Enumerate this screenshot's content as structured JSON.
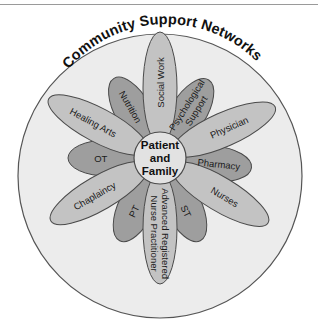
{
  "diagram": {
    "title": "Community Support Networks",
    "center": {
      "lines": [
        "Patient",
        "and",
        "Family"
      ]
    },
    "colors": {
      "outer_circle_fill": "#ececec",
      "outer_circle_stroke": "#555555",
      "long_petal_fill": "#c3c3c3",
      "short_petal_fill": "#9e9e9e",
      "petal_stroke": "#4a4a4a",
      "center_fill": "#e2e2e2"
    },
    "petals": [
      {
        "label": "Social Work",
        "lines": [
          "Social Work"
        ],
        "angle": 0,
        "type": "long"
      },
      {
        "label": "Psychological Support",
        "lines": [
          "Psychological",
          "Support"
        ],
        "angle": 32,
        "type": "short"
      },
      {
        "label": "Physician",
        "lines": [
          "Physician"
        ],
        "angle": 66,
        "type": "long"
      },
      {
        "label": "Pharmacy",
        "lines": [
          "Pharmacy"
        ],
        "angle": 96,
        "type": "short"
      },
      {
        "label": "Nurses",
        "lines": [
          "Nurses"
        ],
        "angle": 121,
        "type": "long"
      },
      {
        "label": "ST",
        "lines": [
          "ST"
        ],
        "angle": 154,
        "type": "short"
      },
      {
        "label": "Advanced Registered Nurse Practitioner",
        "lines": [
          "Advanced Registered",
          "Nurse Practitioner"
        ],
        "angle": 180,
        "type": "long"
      },
      {
        "label": "PT",
        "lines": [
          "PT"
        ],
        "angle": 206,
        "type": "short"
      },
      {
        "label": "Chaplaincy",
        "lines": [
          "Chaplaincy"
        ],
        "angle": 240,
        "type": "long"
      },
      {
        "label": "OT",
        "lines": [
          "OT"
        ],
        "angle": 270,
        "type": "short"
      },
      {
        "label": "Healing Arts",
        "lines": [
          "Healing Arts"
        ],
        "angle": 298,
        "type": "long"
      },
      {
        "label": "Nutrition",
        "lines": [
          "Nutrition"
        ],
        "angle": 330,
        "type": "short"
      }
    ]
  }
}
